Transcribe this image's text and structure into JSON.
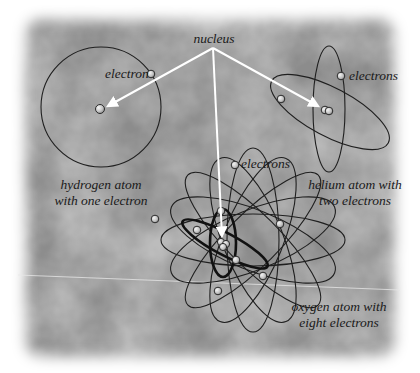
{
  "diagram": {
    "title_label": "nucleus",
    "colors": {
      "background_light": "#b9b9b9",
      "background_dark": "#5e5e5e",
      "orbit": "#1f1f1f",
      "arrow": "#ffffff",
      "electron_fill": "#d8d8d8",
      "label": "#1a1a1a"
    },
    "atoms": [
      {
        "id": "hydrogen",
        "electron_label": "electron",
        "caption_line1": "hydrogen atom",
        "caption_line2": "with one electron",
        "electron_count": 1
      },
      {
        "id": "helium",
        "electron_label": "electrons",
        "caption_line1": "helium atom with",
        "caption_line2": "two electrons",
        "electron_count": 2
      },
      {
        "id": "oxygen",
        "electron_label": "electrons",
        "caption_line1": "oxygen atom with",
        "caption_line2": "eight electrons",
        "electron_count": 8
      }
    ]
  }
}
